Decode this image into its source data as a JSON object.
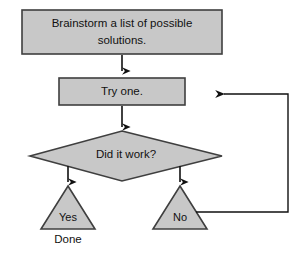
{
  "diagram": {
    "background_color": "#ffffff",
    "shape_fill": "#c8c8c8",
    "shape_stroke": "#3f3f3f",
    "connector_color": "#111111",
    "text_color": "#111111"
  },
  "nodes": {
    "brainstorm": {
      "shape": "process-rectangle",
      "line1": "Brainstorm a list of possible",
      "line2": "solutions."
    },
    "try_one": {
      "shape": "process-rectangle",
      "label": "Try one."
    },
    "decision": {
      "shape": "decision-diamond",
      "label": "Did it work?"
    },
    "yes_branch": {
      "shape": "triangle",
      "label": "Yes"
    },
    "no_branch": {
      "shape": "triangle",
      "label": "No"
    }
  },
  "captions": {
    "done": "Done"
  },
  "connectors": [
    {
      "name": "brainstorm-to-try-one",
      "from": "brainstorm",
      "to": "try_one",
      "arrow": "down"
    },
    {
      "name": "try-one-to-decision",
      "from": "try_one",
      "to": "decision",
      "arrow": "down"
    },
    {
      "name": "decision-to-yes",
      "from": "decision",
      "to": "yes_branch",
      "arrow": "down"
    },
    {
      "name": "decision-to-no",
      "from": "decision",
      "to": "no_branch",
      "arrow": "down"
    },
    {
      "name": "no-feedback-loop",
      "from": "no_branch",
      "to": "try_one",
      "arrow": "left"
    }
  ]
}
